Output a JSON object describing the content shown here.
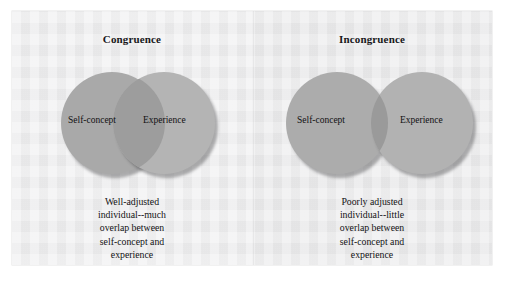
{
  "figure": {
    "panels": [
      {
        "id": "congruence",
        "title": "Congruence",
        "circles": {
          "left_label": "Self-concept",
          "right_label": "Experience",
          "overlap": "much"
        },
        "caption_lines": [
          "Well-adjusted",
          "individual--much",
          "overlap between",
          "self-concept and",
          "experience"
        ]
      },
      {
        "id": "incongruence",
        "title": "Incongruence",
        "circles": {
          "left_label": "Self-concept",
          "right_label": "Experience",
          "overlap": "little"
        },
        "caption_lines": [
          "Poorly adjusted",
          "individual--little",
          "overlap between",
          "self-concept and",
          "experience"
        ]
      }
    ],
    "colors": {
      "page_background": "#ededee",
      "circle_left": "#a9a9a9",
      "circle_right": "#b4b4b4",
      "overlap": "#9b9b9b",
      "text": "#121214"
    }
  }
}
